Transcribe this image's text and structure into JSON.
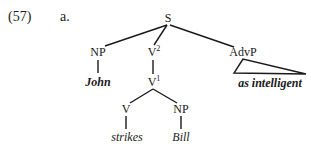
{
  "example": {
    "number": "(57)",
    "sub": "a."
  },
  "tree": {
    "nodes": {
      "S": {
        "label": "S",
        "sup": ""
      },
      "NP1": {
        "label": "NP",
        "sup": ""
      },
      "V2": {
        "label": "V",
        "sup": "2"
      },
      "AdvP": {
        "label": "AdvP",
        "sup": ""
      },
      "V1": {
        "label": "V",
        "sup": "1"
      },
      "V": {
        "label": "V",
        "sup": ""
      },
      "NP2": {
        "label": "NP",
        "sup": ""
      }
    },
    "leaves": {
      "John": "John",
      "strikes": "strikes",
      "Bill": "Bill",
      "as_intelligent": "as intelligent"
    }
  }
}
